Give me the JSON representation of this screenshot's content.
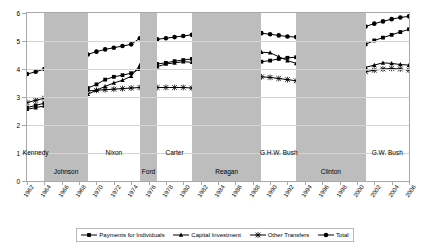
{
  "chart_data": {
    "type": "line",
    "title": "",
    "subtitle": "",
    "xlabel": "",
    "ylabel": "",
    "ylim": [
      0,
      6
    ],
    "yticks": [
      0,
      1,
      2,
      3,
      4,
      5,
      6
    ],
    "ytick_labels": [
      "0",
      "1",
      "2",
      "3",
      "4",
      "5",
      "6"
    ],
    "grid": true,
    "legend_position": "bottom",
    "x": [
      1962,
      1963,
      1964,
      1965,
      1966,
      1967,
      1968,
      1969,
      1970,
      1971,
      1972,
      1973,
      1974,
      1975,
      1976,
      1977,
      1978,
      1979,
      1980,
      1981,
      1982,
      1983,
      1984,
      1985,
      1986,
      1987,
      1988,
      1989,
      1990,
      1991,
      1992,
      1993,
      1994,
      1995,
      1996,
      1997,
      1998,
      1999,
      2000,
      2001,
      2002,
      2003,
      2004,
      2005,
      2006
    ],
    "xtick_labels": [
      "1962",
      "1964",
      "1966",
      "1968",
      "1970",
      "1972",
      "1974",
      "1976",
      "1978",
      "1980",
      "1982",
      "1984",
      "1986",
      "1988",
      "1990",
      "1992",
      "1994",
      "1996",
      "1998",
      "2000",
      "2002",
      "2004",
      "2006"
    ],
    "series": [
      {
        "name": "Payments for Individuals",
        "marker": "square",
        "values": [
          2.62,
          2.7,
          2.78,
          2.82,
          2.9,
          3.05,
          3.22,
          3.32,
          3.45,
          3.62,
          3.72,
          3.78,
          3.85,
          4.0,
          4.1,
          4.18,
          4.22,
          4.28,
          4.32,
          4.36,
          4.38,
          4.4,
          4.36,
          4.34,
          4.32,
          4.3,
          4.28,
          4.26,
          4.3,
          4.36,
          4.4,
          4.42,
          4.42,
          4.46,
          4.48,
          4.52,
          4.58,
          4.66,
          4.76,
          4.88,
          5.02,
          5.12,
          5.22,
          5.32,
          5.42
        ]
      },
      {
        "name": "Capital Investment",
        "marker": "triangle",
        "values": [
          2.56,
          2.62,
          2.68,
          2.7,
          2.78,
          2.92,
          3.02,
          3.1,
          3.24,
          3.38,
          3.5,
          3.6,
          3.74,
          4.14,
          4.04,
          4.08,
          4.18,
          4.22,
          4.26,
          4.24,
          4.18,
          4.14,
          4.22,
          4.32,
          4.42,
          4.5,
          4.56,
          4.6,
          4.58,
          4.44,
          4.3,
          4.2,
          4.12,
          4.06,
          4.02,
          3.98,
          3.96,
          3.98,
          4.0,
          4.06,
          4.14,
          4.22,
          4.2,
          4.16,
          4.14
        ]
      },
      {
        "name": "Other Transfers",
        "marker": "star",
        "values": [
          2.8,
          2.88,
          2.96,
          3.02,
          3.08,
          3.14,
          3.2,
          3.22,
          3.24,
          3.26,
          3.28,
          3.3,
          3.32,
          3.34,
          3.34,
          3.34,
          3.34,
          3.34,
          3.34,
          3.32,
          3.3,
          3.34,
          3.42,
          3.52,
          3.6,
          3.66,
          3.7,
          3.72,
          3.7,
          3.66,
          3.62,
          3.58,
          3.56,
          3.58,
          3.62,
          3.66,
          3.72,
          3.78,
          3.84,
          3.9,
          3.96,
          4.0,
          4.02,
          4.0,
          3.96
        ]
      },
      {
        "name": "Total",
        "marker": "circle",
        "values": [
          3.82,
          3.9,
          4.0,
          4.08,
          4.18,
          4.32,
          4.44,
          4.52,
          4.62,
          4.7,
          4.76,
          4.82,
          4.88,
          5.1,
          5.04,
          5.06,
          5.1,
          5.14,
          5.18,
          5.22,
          5.24,
          5.26,
          5.28,
          5.3,
          5.32,
          5.32,
          5.3,
          5.28,
          5.24,
          5.2,
          5.16,
          5.14,
          5.12,
          5.12,
          5.14,
          5.18,
          5.24,
          5.32,
          5.42,
          5.52,
          5.62,
          5.7,
          5.78,
          5.84,
          5.88
        ]
      }
    ],
    "presidential_terms": [
      {
        "name": "Kennedy",
        "start": 1962,
        "end": 1964,
        "shaded": false,
        "row": "top"
      },
      {
        "name": "Johnson",
        "start": 1964,
        "end": 1969,
        "shaded": true,
        "row": "bottom"
      },
      {
        "name": "Nixon",
        "start": 1969,
        "end": 1975,
        "shaded": false,
        "row": "top"
      },
      {
        "name": "Ford",
        "start": 1975,
        "end": 1977,
        "shaded": true,
        "row": "bottom"
      },
      {
        "name": "Carter",
        "start": 1977,
        "end": 1981,
        "shaded": false,
        "row": "top"
      },
      {
        "name": "Reagan",
        "start": 1981,
        "end": 1989,
        "shaded": true,
        "row": "bottom"
      },
      {
        "name": "G.H.W. Bush",
        "start": 1989,
        "end": 1993,
        "shaded": false,
        "row": "top"
      },
      {
        "name": "Clinton",
        "start": 1993,
        "end": 2001,
        "shaded": true,
        "row": "bottom"
      },
      {
        "name": "G.W. Bush",
        "start": 2001,
        "end": 2006,
        "shaded": false,
        "row": "top"
      }
    ]
  },
  "legend": {
    "items": [
      {
        "label": "Payments for Individuals",
        "marker": "square"
      },
      {
        "label": "Capital Investment",
        "marker": "triangle"
      },
      {
        "label": "Other Transfers",
        "marker": "star"
      },
      {
        "label": "Total",
        "marker": "circle"
      }
    ]
  },
  "colors": {
    "line": "#000000",
    "band": "#bdbdbd",
    "grid": "#d4d4d4",
    "axis": "#a9a9a9",
    "background": "#ffffff"
  }
}
